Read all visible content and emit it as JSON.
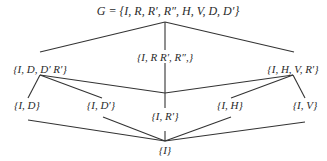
{
  "diagram": {
    "type": "subgroup-lattice",
    "line_color": "#333333",
    "nodes": {
      "top": {
        "label": "G = {I, R, R′, R″, H, V, D, D′}"
      },
      "rotations": {
        "label": "{I, R R′, R″,}"
      },
      "left_mid": {
        "label": "{I, D, D′ R′}"
      },
      "right_mid": {
        "label": "{I, H, V, R′}"
      },
      "i_d": {
        "label": "{I, D}"
      },
      "i_dp": {
        "label": "{I, D′}"
      },
      "i_rp": {
        "label": "{I, R′}"
      },
      "i_h": {
        "label": "{I, H}"
      },
      "i_v": {
        "label": "{I, V}"
      },
      "bottom": {
        "label": "{I}"
      }
    },
    "edges": [
      [
        "top",
        "left_mid"
      ],
      [
        "top",
        "rotations"
      ],
      [
        "top",
        "right_mid"
      ],
      [
        "left_mid",
        "i_d"
      ],
      [
        "left_mid",
        "i_dp"
      ],
      [
        "left_mid",
        "i_rp"
      ],
      [
        "right_mid",
        "i_h"
      ],
      [
        "right_mid",
        "i_v"
      ],
      [
        "right_mid",
        "i_rp"
      ],
      [
        "rotations",
        "i_rp"
      ],
      [
        "i_d",
        "bottom"
      ],
      [
        "i_dp",
        "bottom"
      ],
      [
        "i_rp",
        "bottom"
      ],
      [
        "i_h",
        "bottom"
      ],
      [
        "i_v",
        "bottom"
      ]
    ]
  }
}
